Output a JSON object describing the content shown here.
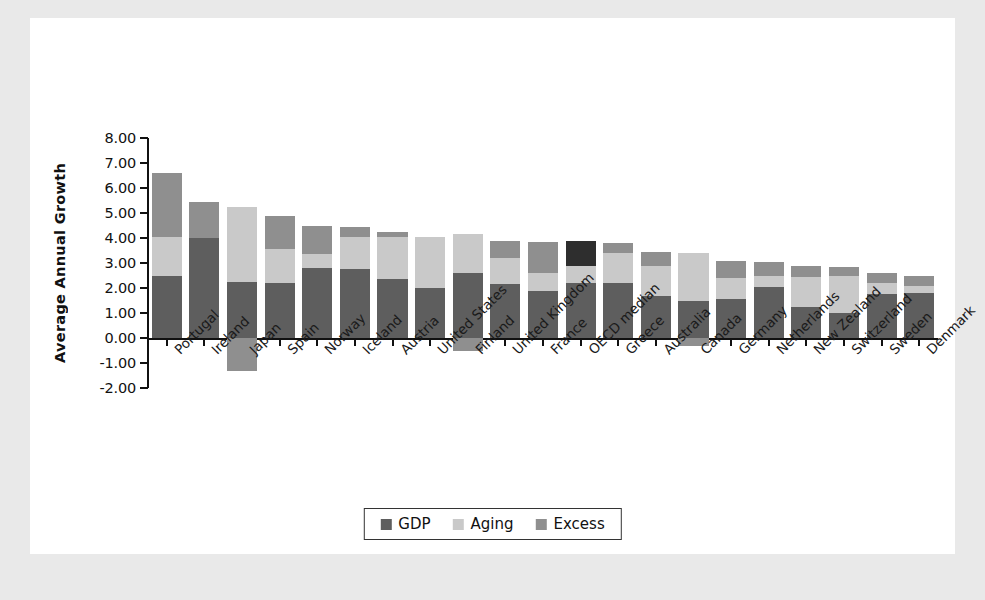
{
  "chart_data": {
    "type": "bar",
    "subtype": "stacked-bar",
    "title": "",
    "xlabel": "",
    "ylabel": "Average Annual Growth",
    "ylim": [
      -2.0,
      8.0
    ],
    "ytick_step": 1.0,
    "ytick_labels": [
      "8.00",
      "7.00",
      "6.00",
      "5.00",
      "4.00",
      "3.00",
      "2.00",
      "1.00",
      "0.00",
      "-1.00",
      "-2.00"
    ],
    "ytick_values": [
      8.0,
      7.0,
      6.0,
      5.0,
      4.0,
      3.0,
      2.0,
      1.0,
      0.0,
      -1.0,
      -2.0
    ],
    "grid": false,
    "legend_position": "bottom",
    "categories": [
      "Portugal",
      "Ireland",
      "Japan",
      "Spain",
      "Norway",
      "Iceland",
      "Austria",
      "United States",
      "Finland",
      "United Kingdom",
      "France",
      "OECD median",
      "Greece",
      "Australia",
      "Canada",
      "Germany",
      "Netherlands",
      "New Zealand",
      "Switzerland",
      "Sweden",
      "Denmark"
    ],
    "series": [
      {
        "name": "GDP",
        "color": "#5e5e5e",
        "values": [
          2.5,
          4.0,
          2.25,
          2.2,
          2.8,
          2.75,
          2.35,
          2.0,
          2.6,
          2.15,
          1.9,
          2.2,
          2.2,
          1.7,
          1.5,
          1.55,
          2.05,
          1.25,
          1.0,
          1.75,
          1.8
        ]
      },
      {
        "name": "Aging",
        "color": "#c9c9c9",
        "values": [
          1.55,
          0.0,
          3.0,
          1.35,
          0.55,
          1.3,
          1.7,
          2.05,
          1.55,
          1.05,
          0.7,
          0.7,
          1.2,
          1.2,
          1.9,
          0.85,
          0.45,
          1.2,
          1.5,
          0.45,
          0.3
        ]
      },
      {
        "name": "Excess",
        "color": "#8f8f8f",
        "values": [
          2.55,
          1.45,
          -1.3,
          1.35,
          1.15,
          0.4,
          0.2,
          0.0,
          -0.5,
          0.7,
          1.25,
          1.0,
          0.4,
          0.55,
          -0.3,
          0.7,
          0.55,
          0.45,
          0.35,
          0.4,
          0.4
        ]
      }
    ],
    "totals": [
      6.6,
      5.45,
      5.25,
      4.9,
      4.5,
      4.45,
      4.25,
      4.05,
      4.15,
      3.9,
      3.85,
      3.9,
      3.8,
      3.45,
      3.4,
      3.1,
      3.05,
      2.9,
      2.85,
      2.6,
      2.5
    ],
    "negative_excess_categories": [
      "Japan",
      "Finland",
      "Canada"
    ],
    "highlight": {
      "category": "OECD median",
      "series": "Excess",
      "color": "#2e2e2e"
    }
  },
  "legend": {
    "items": [
      {
        "label": "GDP",
        "color": "#5e5e5e"
      },
      {
        "label": "Aging",
        "color": "#c9c9c9"
      },
      {
        "label": "Excess",
        "color": "#8f8f8f"
      }
    ]
  },
  "axis": {
    "y_title": "Average Annual Growth"
  }
}
